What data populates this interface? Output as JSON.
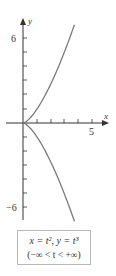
{
  "chart_data": {
    "type": "line",
    "title": "",
    "xlabel": "x",
    "ylabel": "y",
    "x_ticks": [
      1,
      2,
      3,
      4,
      5
    ],
    "x_tick_labels": {
      "5": "5"
    },
    "y_ticks": [
      -6,
      -5,
      -4,
      -3,
      -2,
      -1,
      1,
      2,
      3,
      4,
      5,
      6
    ],
    "y_tick_labels": {
      "6": "6",
      "-6": "-6"
    },
    "xlim": [
      0,
      6
    ],
    "ylim": [
      -7,
      7
    ],
    "grid": false,
    "series": [
      {
        "name": "x = t^2, y = t^3",
        "parametric": true,
        "t_range": [
          -1.91,
          1.91
        ],
        "x": [
          3.65,
          2.56,
          1.69,
          1.0,
          0.49,
          0.16,
          0.0,
          0.16,
          0.49,
          1.0,
          1.69,
          2.56,
          3.65
        ],
        "y": [
          -6.97,
          -4.1,
          -2.2,
          -1.0,
          -0.34,
          -0.06,
          0.0,
          0.06,
          0.34,
          1.0,
          2.2,
          4.1,
          6.97
        ]
      }
    ],
    "annotation": {
      "equation": "x = t², y = t³",
      "domain": "(−∞ < t < +∞)"
    },
    "colors": {
      "curve": "#7a7a7a",
      "axis": "#333333"
    }
  },
  "labels": {
    "x_axis": "x",
    "y_axis": "y",
    "y_top": "6",
    "y_bottom": "−6",
    "x_five": "5"
  },
  "caption": {
    "equation": "x = t², y = t³",
    "range": "(−∞ < t < +∞)"
  }
}
